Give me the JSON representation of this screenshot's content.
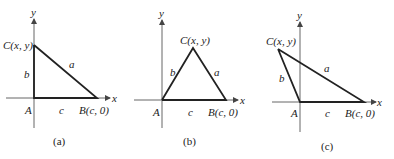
{
  "panels": [
    {
      "caption": "(a)",
      "axis_x_label": "x",
      "axis_y_label": "y",
      "vertex_A": "A",
      "vertex_B": "B(c, 0)",
      "vertex_C": "C(x, y)",
      "side_a": "a",
      "side_b": "b",
      "side_c": "c",
      "type": "right angle at A"
    },
    {
      "caption": "(b)",
      "axis_x_label": "x",
      "axis_y_label": "y",
      "vertex_A": "A",
      "vertex_B": "B(c, 0)",
      "vertex_C": "C(x, y)",
      "side_a": "a",
      "side_b": "b",
      "side_c": "c",
      "type": "acute angle at A"
    },
    {
      "caption": "(c)",
      "axis_x_label": "x",
      "axis_y_label": "y",
      "vertex_A": "A",
      "vertex_B": "B(c, 0)",
      "vertex_C": "C(x, y)",
      "side_a": "a",
      "side_b": "b",
      "side_c": "c",
      "type": "obtuse angle at A"
    }
  ]
}
